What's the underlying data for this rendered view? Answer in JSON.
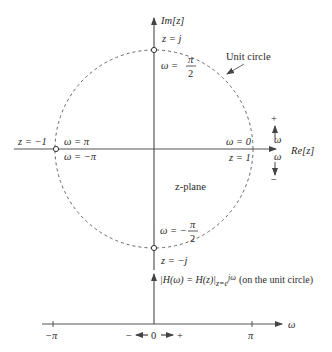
{
  "figure": {
    "colors": {
      "axis": "#555555",
      "circle": "#666666",
      "text": "#2a2a2a",
      "background": "#ffffff"
    }
  },
  "zplane": {
    "vertical_axis_label": "Im[z]",
    "horizontal_axis_label": "Re[z]",
    "plane_label": "z-plane",
    "unit_circle_label": "Unit circle",
    "points": {
      "top": {
        "z": "z = j",
        "omega_prefix": "ω =",
        "omega_num": "π",
        "omega_den": "2"
      },
      "bottom": {
        "z": "z = −j",
        "omega_prefix": "ω = −",
        "omega_num": "π",
        "omega_den": "2"
      },
      "left": {
        "z": "z = −1",
        "omega_above": "ω = π",
        "omega_below": "ω = −π"
      },
      "right": {
        "z": "z = 1",
        "omega_above": "ω = 0"
      }
    },
    "direction": {
      "plus": "+",
      "minus": "−",
      "omega": "ω"
    }
  },
  "mapping": {
    "formula_lhs": "|H(ω) = H(z)|",
    "formula_sub": "z=e",
    "formula_sup": "jω",
    "formula_note": "(on the unit circle)"
  },
  "frequency_axis": {
    "label": "ω",
    "ticks": [
      "−π",
      "0",
      "π"
    ],
    "direction_minus": "−",
    "direction_plus": "+"
  }
}
